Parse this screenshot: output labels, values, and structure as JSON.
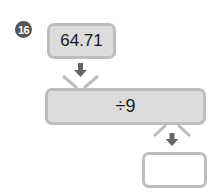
{
  "problem": {
    "number": "16",
    "start_value": "64.71",
    "operation": "÷9",
    "answer": ""
  },
  "colors": {
    "badge": "#555555",
    "box_fill": "#dcdcdc",
    "box_border": "#bdbdbd",
    "arrow": "#666666"
  }
}
